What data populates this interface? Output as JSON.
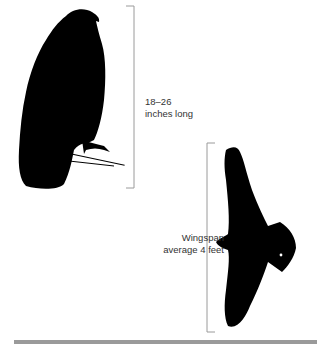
{
  "figure": {
    "perched_bird": {
      "icon": "perched-hawk-silhouette",
      "measure_label_line1": "18–26",
      "measure_label_line2": "inches long"
    },
    "flying_bird": {
      "icon": "flying-hawk-silhouette",
      "measure_label_line1": "Wingspan",
      "measure_label_line2": "average 4 feet"
    },
    "colors": {
      "silhouette": "#000000",
      "bracket": "#9a9a9a",
      "text": "#333333",
      "rule": "#9a9a9a"
    }
  }
}
